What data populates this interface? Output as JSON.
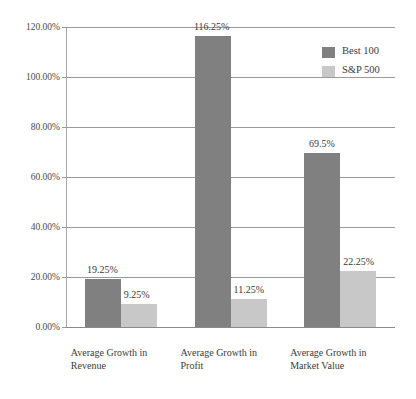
{
  "chart_data": {
    "type": "bar",
    "title": "",
    "xlabel": "",
    "ylabel": "",
    "ylim": [
      0,
      120
    ],
    "ytick_step": 20,
    "grid": true,
    "legend_position": "top-right",
    "categories": [
      "Average Growth in Revenue",
      "Average Growth in Profit",
      "Average Growth in Market Value"
    ],
    "category_lines": [
      [
        "Average Growth in",
        "Revenue"
      ],
      [
        "Average Growth in",
        "Profit"
      ],
      [
        "Average Growth in",
        "Market Value"
      ]
    ],
    "series": [
      {
        "name": "Best 100",
        "color": "#808080",
        "values": [
          19.25,
          116.25,
          69.5
        ],
        "labels": [
          "19.25%",
          "116.25%",
          "69.5%"
        ]
      },
      {
        "name": "S&P 500",
        "color": "#c8c8c8",
        "values": [
          9.25,
          11.25,
          22.25
        ],
        "labels": [
          "9.25%",
          "11.25%",
          "22.25%"
        ]
      }
    ],
    "ytick_labels": [
      "0.00%",
      "20.00%",
      "40.00%",
      "60.00%",
      "80.00%",
      "100.00%",
      "120.00%"
    ],
    "ytick_values": [
      0,
      20,
      40,
      60,
      80,
      100,
      120
    ]
  },
  "legend": {
    "entries": [
      {
        "label": "Best 100",
        "color": "#808080"
      },
      {
        "label": "S&P 500",
        "color": "#c8c8c8"
      }
    ]
  },
  "colors": {
    "series_best_100": "#808080",
    "series_sp_500": "#c8c8c8",
    "gridline": "#9a9a9a",
    "axis": "#a8a8a8",
    "text": "#3a3a3a",
    "background": "#ffffff"
  }
}
